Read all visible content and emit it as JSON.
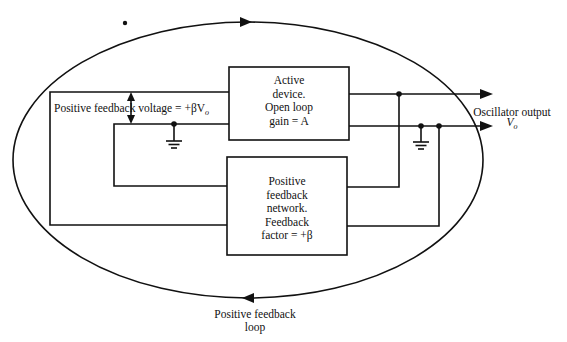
{
  "diagram": {
    "active_device": {
      "lines": [
        "Active",
        "device.",
        "Open loop",
        "gain = A"
      ]
    },
    "feedback_network": {
      "lines": [
        "Positive",
        "feedback",
        "network.",
        "Feedback",
        "factor = +β"
      ]
    },
    "feedback_voltage_label": "Positive feedback voltage = +βV",
    "feedback_voltage_subscript": "o",
    "output_label": "Oscillator output",
    "output_symbol": "V",
    "output_symbol_subscript": "o",
    "loop_label": [
      "Positive feedback",
      "loop"
    ],
    "icons": [
      "ground-icon",
      "ground-icon",
      "arrow-right-icon",
      "arrow-right-icon",
      "loop-arrow-right-icon",
      "loop-arrow-left-icon",
      "double-arrow-icon",
      "junction-dot-icon"
    ],
    "colors": {
      "line": "#111111",
      "background": "#ffffff"
    }
  }
}
